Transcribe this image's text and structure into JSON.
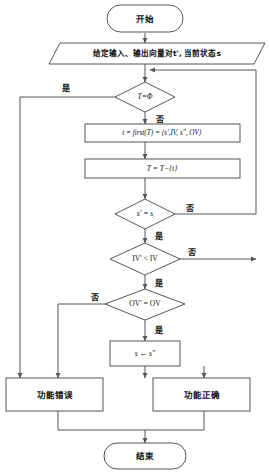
{
  "diagram": {
    "type": "flowchart",
    "colors": {
      "stroke": "#555555",
      "fill": "#ffffff",
      "text": "#111111",
      "background": "#ffffff"
    },
    "nodes": [
      {
        "id": "start",
        "shape": "terminator",
        "label": "开始"
      },
      {
        "id": "input",
        "shape": "parallelogram",
        "label": "给定输入、输出向量对t', 当前状态s"
      },
      {
        "id": "d-empty",
        "shape": "diamond",
        "label": "T=Φ"
      },
      {
        "id": "first",
        "shape": "process",
        "label": "t = first(T) = ⟨s',IV, s\", OV⟩"
      },
      {
        "id": "remove",
        "shape": "process",
        "label": "T = T−{t}"
      },
      {
        "id": "d-state",
        "shape": "diamond",
        "label": "s' = s"
      },
      {
        "id": "d-iv",
        "shape": "diamond",
        "label": "IV' < IV"
      },
      {
        "id": "d-ov",
        "shape": "diamond",
        "label": "OV' = OV"
      },
      {
        "id": "assign",
        "shape": "process",
        "label": "s ← s\""
      },
      {
        "id": "fail",
        "shape": "process",
        "label": "功能错误"
      },
      {
        "id": "pass",
        "shape": "process",
        "label": "功能正确"
      },
      {
        "id": "end",
        "shape": "terminator",
        "label": "结束"
      }
    ],
    "edge_labels": {
      "empty_yes": "是",
      "empty_no": "否",
      "state_no": "否",
      "state_yes": "是",
      "iv_no": "否",
      "iv_yes": "是",
      "ov_no": "否",
      "ov_yes": "是"
    },
    "edges": [
      {
        "from": "start",
        "to": "input",
        "label": ""
      },
      {
        "from": "input",
        "to": "d-empty",
        "label": ""
      },
      {
        "from": "d-empty",
        "to": "pass",
        "label": "是"
      },
      {
        "from": "d-empty",
        "to": "first",
        "label": "否"
      },
      {
        "from": "first",
        "to": "remove",
        "label": ""
      },
      {
        "from": "remove",
        "to": "d-state",
        "label": ""
      },
      {
        "from": "d-state",
        "to": "d-empty",
        "label": "否"
      },
      {
        "from": "d-state",
        "to": "d-iv",
        "label": "是"
      },
      {
        "from": "d-iv",
        "to": "d-empty",
        "label": "否"
      },
      {
        "from": "d-iv",
        "to": "d-ov",
        "label": "是"
      },
      {
        "from": "d-ov",
        "to": "fail",
        "label": "否"
      },
      {
        "from": "d-ov",
        "to": "assign",
        "label": "是"
      },
      {
        "from": "assign",
        "to": "fail",
        "label": ""
      },
      {
        "from": "fail",
        "to": "end",
        "label": ""
      },
      {
        "from": "pass",
        "to": "end",
        "label": ""
      }
    ]
  }
}
